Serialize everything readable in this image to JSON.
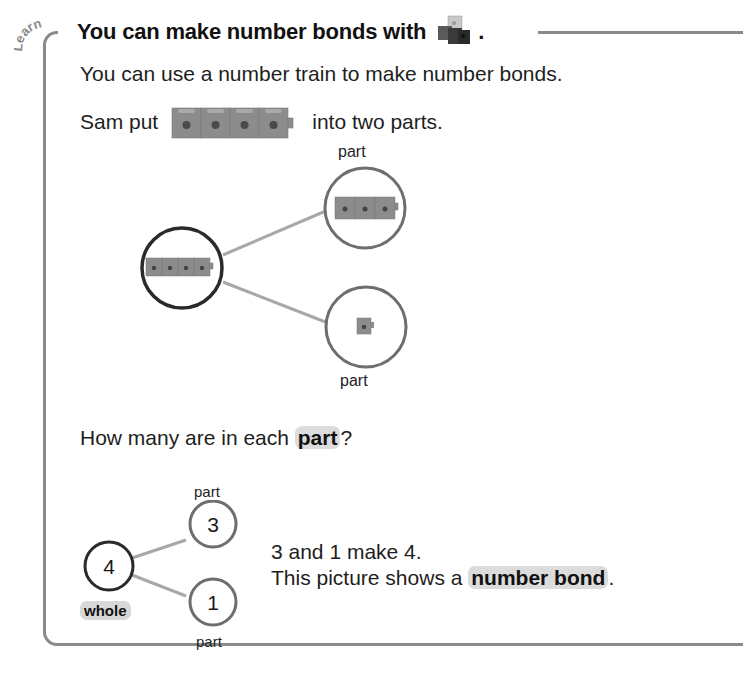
{
  "section_tag": "Learn",
  "title": {
    "text": "You can make number bonds with",
    "icon": "linking-cubes-icon",
    "end": "."
  },
  "intro": "You can use a number train to make number bonds.",
  "sentence": {
    "before": "Sam put",
    "icon": "four-cube-train-icon",
    "after": "into two parts."
  },
  "cube_diagram": {
    "whole_cubes": 4,
    "parts": [
      {
        "label": "part",
        "cubes": 3
      },
      {
        "label": "part",
        "cubes": 1
      }
    ]
  },
  "question": {
    "before": "How many are in each",
    "highlight": "part",
    "after": "?"
  },
  "number_bond": {
    "whole": {
      "value": "4",
      "label": "whole"
    },
    "parts": [
      {
        "value": "3",
        "label": "part"
      },
      {
        "value": "1",
        "label": "part"
      }
    ]
  },
  "explanation": {
    "line1": "3 and 1 make 4.",
    "line2_before": "This picture shows a",
    "line2_highlight": "number bond",
    "line2_after": "."
  },
  "colors": {
    "frame": "#8a8a8a",
    "whole_circle": "#2a2a2a",
    "part_circle": "#6e6e6e",
    "connector": "#a8a8a8",
    "cube": "#8c8c8c",
    "highlight": "#dcdcdc"
  }
}
